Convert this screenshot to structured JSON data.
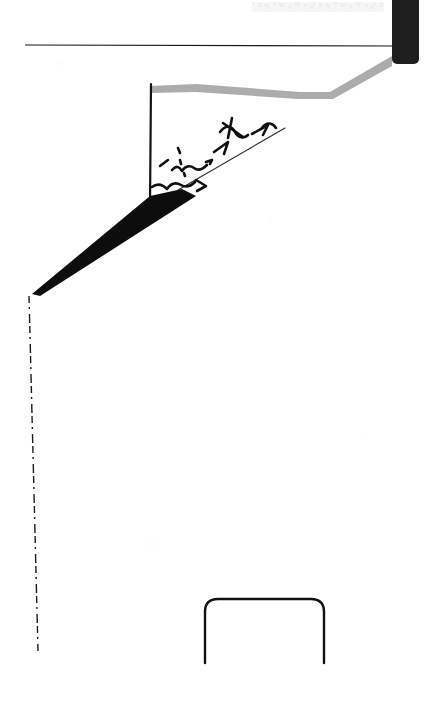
{
  "document": {
    "kind": "scanned-document-fragment",
    "width": 435,
    "height": 707,
    "background_color": "#ffffff",
    "ink_color": "#111111",
    "mid_gray": "#8a8a8a",
    "faint_gray": "#c9c9c9",
    "caption": "Scanned page fragment with line art and handwritten marks"
  },
  "marks": {
    "top_smudge": {
      "name": "faint-smudge-text",
      "legible": false,
      "x": 252,
      "y": 2,
      "width": 132,
      "height": 10,
      "color": "#dcdcdc"
    },
    "horizontal_rule": {
      "name": "horizontal-rule",
      "x1": 25,
      "y1": 45,
      "x2": 396,
      "y2": 46,
      "color": "#1a1a1a",
      "thickness": 1.2
    },
    "dark_bar": {
      "name": "dark-vertical-bar",
      "x": 392,
      "y": -4,
      "width": 27,
      "height": 68,
      "corner_radius": 5,
      "color": "#1f1f1f"
    },
    "gray_band": {
      "name": "gray-angled-band",
      "color": "#9a9a9a",
      "points": "150,86 196,84 300,92 330,92 392,56 392,66 333,99 298,99 196,92 150,93"
    },
    "vertical_stroke": {
      "name": "vertical-ink-stroke",
      "x1": 151,
      "y1": 84,
      "x2": 150,
      "y2": 206,
      "color": "#141414",
      "thickness": 2.2
    },
    "thick_wedge": {
      "name": "thick-diagonal-wedge",
      "color": "#0d0d0d",
      "points": "32,294 150,196 182,189 196,196 40,296"
    },
    "thin_diagonal": {
      "name": "thin-diagonal-line",
      "x1": 178,
      "y1": 190,
      "x2": 285,
      "y2": 128,
      "color": "#2b2b2b",
      "thickness": 1.1
    },
    "dashed_vertical": {
      "name": "dashed-vertical-line",
      "x1": 29,
      "y1": 296,
      "x2": 38,
      "y2": 651,
      "color": "#1c1c1c",
      "thickness": 1.4,
      "dash_pattern": "7 4 2 5 9 3"
    },
    "rounded_frame": {
      "name": "rounded-rectangle-frame",
      "x": 205,
      "y": 599,
      "width": 119,
      "height": 64,
      "corner_radius": 13,
      "color": "#111111",
      "thickness": 2.4,
      "open_bottom": true
    },
    "handwriting": {
      "name": "handwritten-scribbles",
      "legible": false,
      "note": "illegible cursive pen marks",
      "strokes": [
        "M160,166 l8,-6",
        "M172,170 c5,-6 8,-2 10,1 c3,-5 8,-6 12,-3 c4,3 9,1 13,-3",
        "M206,162 l6,-2 l-2,4",
        "M152,187 c7,-5 12,-1 15,2 c4,-6 9,-7 14,-4 c5,3 10,1 14,-3",
        "M196,180 l10,6 l-9,5",
        "M214,152 l14,-10 l-4,12",
        "M220,132 c6,-8 12,-6 15,0 c3,6 9,7 13,3",
        "M223,123 l20,14",
        "M232,118 l-4,20",
        "M252,134 l16,-9 l-5,10",
        "M262,128 c5,-7 11,-5 14,0",
        "M178,148 l2,5",
        "M180,160 l1,4",
        "M184,173 l1,3"
      ]
    }
  }
}
